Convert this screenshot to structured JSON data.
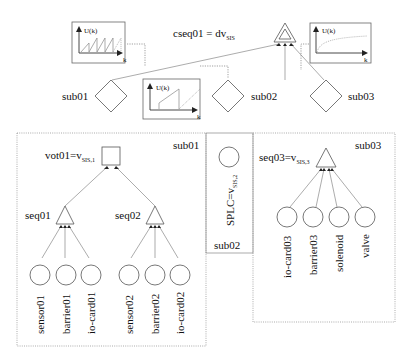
{
  "top_level": {
    "gate_label": "cseq01 = dv",
    "gate_subscript": "SIS",
    "subsystems": [
      {
        "label": "sub01"
      },
      {
        "label": "sub02"
      },
      {
        "label": "sub03"
      }
    ],
    "plots": [
      {
        "y_label": "U(k)",
        "x_label": "k",
        "shape": "sawtooth-dense"
      },
      {
        "y_label": "U(k)",
        "x_label": "k",
        "shape": "sawtooth-sparse"
      },
      {
        "y_label": "U(k)",
        "x_label": "k",
        "shape": "saturating"
      }
    ]
  },
  "sub01": {
    "frame_label": "sub01",
    "voter_label": "vot01=v",
    "voter_subscript": "SIS,1",
    "gates": [
      {
        "label": "seq01",
        "inputs": [
          "sensor01",
          "barrier01",
          "io-card01"
        ]
      },
      {
        "label": "seq02",
        "inputs": [
          "sensor02",
          "barrier02",
          "io-card02"
        ]
      }
    ]
  },
  "sub02": {
    "frame_label": "sub02",
    "event_label": "SPLC=v",
    "event_subscript": "SIS,2"
  },
  "sub03": {
    "frame_label": "sub03",
    "gate_label": "seq03=v",
    "gate_subscript": "SIS,3",
    "inputs": [
      "io-card03",
      "barrier03",
      "solenoid",
      "valve"
    ]
  }
}
